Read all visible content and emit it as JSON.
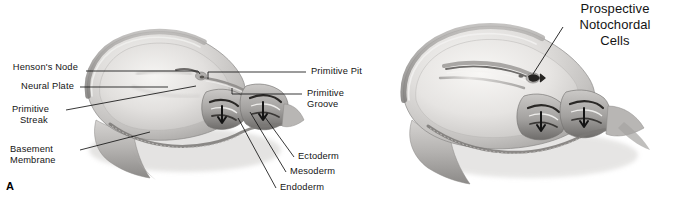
{
  "figure": {
    "panel_letter": "A",
    "background_color": "#ffffff",
    "ink_color": "#141414",
    "tissue_light": "#eceae8",
    "tissue_mid": "#cfcdcb",
    "tissue_dark": "#8e8c8a",
    "tissue_shadow": "#5a5856"
  },
  "panel_a": {
    "labels": {
      "hensons_node": "Henson's Node",
      "neural_plate": "Neural Plate",
      "primitive_streak_l1": "Primitive",
      "primitive_streak_l2": "Streak",
      "basement_membrane_l1": "Basement",
      "basement_membrane_l2": "Membrane",
      "primitive_pit": "Primitive Pit",
      "primitive_groove_l1": "Primitive",
      "primitive_groove_l2": "Groove",
      "ectoderm": "Ectoderm",
      "mesoderm": "Mesoderm",
      "endoderm": "Endoderm"
    }
  },
  "panel_b": {
    "labels": {
      "prospective_l1": "Prospective",
      "prospective_l2": "Notochordal",
      "prospective_l3": "Cells"
    }
  }
}
